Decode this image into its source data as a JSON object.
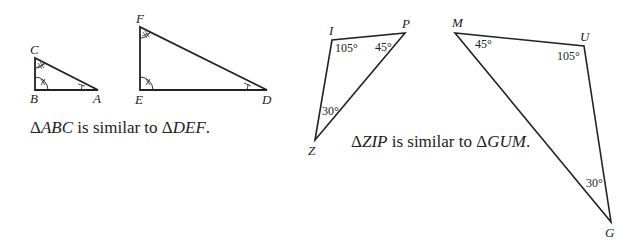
{
  "figures": [
    {
      "id": "ABC",
      "vertices": {
        "A": [
          98,
          90
        ],
        "B": [
          35,
          90
        ],
        "C": [
          35,
          58
        ]
      },
      "labels": {
        "A": "A",
        "B": "B",
        "C": "C"
      }
    },
    {
      "id": "DEF",
      "vertices": {
        "D": [
          267,
          90
        ],
        "E": [
          140,
          90
        ],
        "F": [
          140,
          27
        ]
      },
      "labels": {
        "D": "D",
        "E": "E",
        "F": "F"
      }
    },
    {
      "id": "ZIP",
      "vertices": {
        "Z": [
          315,
          140
        ],
        "I": [
          332,
          40
        ],
        "P": [
          405,
          33
        ]
      },
      "labels": {
        "Z": "Z",
        "I": "I",
        "P": "P"
      },
      "angles": {
        "I": "105°",
        "P": "45°",
        "Z": "30°"
      }
    },
    {
      "id": "GUM",
      "vertices": {
        "G": [
          611,
          222
        ],
        "U": [
          584,
          46
        ],
        "M": [
          455,
          33
        ]
      },
      "labels": {
        "G": "G",
        "U": "U",
        "M": "M"
      },
      "angles": {
        "M": "45°",
        "U": "105°",
        "G": "30°"
      }
    }
  ],
  "captions": {
    "abc_def": {
      "delta1": "Δ",
      "tri1": "ABC",
      "mid": " is similar to ",
      "delta2": "Δ",
      "tri2": "DEF",
      "end": "."
    },
    "zip_gum": {
      "delta1": "Δ",
      "tri1": "ZIP",
      "mid": " is similar to ",
      "delta2": "Δ",
      "tri2": "GUM",
      "end": "."
    }
  },
  "colors": {
    "stroke": "#222222",
    "background": "#ffffff"
  }
}
